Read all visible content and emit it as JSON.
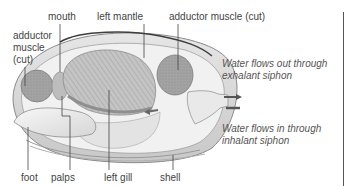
{
  "diagram": {
    "labels": {
      "mouth": "mouth",
      "left_mantle": "left mantle",
      "adductor_right": "adductor muscle (cut)",
      "adductor_left_line1": "adductor",
      "adductor_left_line2": "muscle",
      "adductor_left_line3": "(cut)",
      "foot": "foot",
      "palps": "palps",
      "left_gill": "left gill",
      "shell": "shell"
    },
    "annotations": {
      "exhalant_line1": "Water flows out through",
      "exhalant_line2": "exhalant siphon",
      "inhalant_line1": "Water flows in through",
      "inhalant_line2": "inhalant siphon"
    },
    "colors": {
      "shell": "#d9d9d9",
      "body": "#ececec",
      "muscle": "#9a9a9a",
      "gill": "#b8b8b8",
      "arrow": "#555555",
      "leader": "#444444"
    }
  }
}
